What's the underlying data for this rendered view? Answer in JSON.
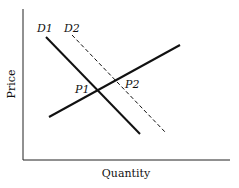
{
  "diagram": {
    "type": "supply-demand",
    "axes": {
      "x_label": "Quantity",
      "y_label": "Price"
    },
    "curves": [
      {
        "id": "D1",
        "label": "D1",
        "style": "solid"
      },
      {
        "id": "D2",
        "label": "D2",
        "style": "dashed"
      },
      {
        "id": "S",
        "label": "",
        "style": "solid"
      }
    ],
    "points": [
      {
        "label": "P1"
      },
      {
        "label": "P2"
      }
    ],
    "colors": {
      "line": "#111111",
      "background": "#ffffff"
    }
  }
}
